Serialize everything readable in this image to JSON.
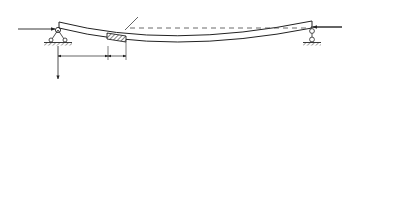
{
  "figure_a": {
    "caption": "a)",
    "axial_force_left": "N",
    "axial_force_right": "N",
    "axis_x": "x",
    "axis_y": "y",
    "position_label": "x",
    "element_width_label": "dx",
    "deflection_label": "y(x,t)"
  },
  "figure_b": {
    "caption": "b)",
    "axial_force_left": "N",
    "axial_force_right": "N",
    "moment_left": "M(x,t)",
    "shear_left": "Q(x,t)",
    "distributed_load": "f",
    "distributed_load_sub": "1",
    "distributed_load_args": "(x,t)",
    "moment_right_base": "M(x,t)+",
    "moment_right_num": "∂M(x,t)",
    "moment_right_den": "∂x",
    "moment_right_tail": "dx",
    "shear_right_base": "Q(x,t)+",
    "shear_right_num": "∂Q(x,t)",
    "shear_right_den": "∂x",
    "shear_right_tail": "dx",
    "slope_num": "∂y(x,t)",
    "slope_den": "∂x",
    "slope_tail": "dx",
    "element_width_label": "dx"
  }
}
